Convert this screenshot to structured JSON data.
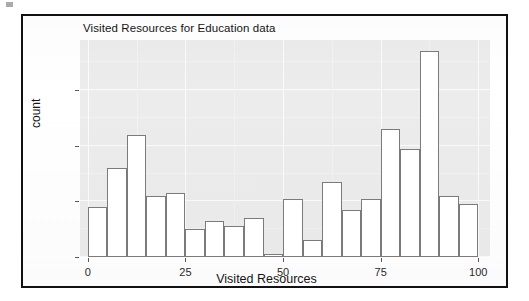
{
  "figure": {
    "title": "Visited Resources for Education data"
  },
  "chart_data": {
    "type": "bar",
    "title": "Visited Resources for Education data",
    "xlabel": "Visited Resources",
    "ylabel": "count",
    "xlim": [
      -2,
      103
    ],
    "ylim": [
      0,
      78
    ],
    "grid": true,
    "legend": null,
    "bin_width": 5,
    "x_ticks": [
      0,
      25,
      50,
      75,
      100
    ],
    "x_tick_labels": [
      "0",
      "25",
      "50",
      "75",
      "100"
    ],
    "y_ticks": [
      0,
      20,
      40,
      60
    ],
    "y_tick_labels": [
      "0",
      "20",
      "40",
      "60"
    ],
    "bins": [
      {
        "start": 0,
        "end": 5,
        "center": 2.5,
        "count": 18
      },
      {
        "start": 5,
        "end": 10,
        "center": 7.5,
        "count": 32
      },
      {
        "start": 10,
        "end": 15,
        "center": 12.5,
        "count": 44
      },
      {
        "start": 15,
        "end": 20,
        "center": 17.5,
        "count": 22
      },
      {
        "start": 20,
        "end": 25,
        "center": 22.5,
        "count": 23
      },
      {
        "start": 25,
        "end": 30,
        "center": 27.5,
        "count": 10
      },
      {
        "start": 30,
        "end": 35,
        "center": 32.5,
        "count": 13
      },
      {
        "start": 35,
        "end": 40,
        "center": 37.5,
        "count": 11
      },
      {
        "start": 40,
        "end": 45,
        "center": 42.5,
        "count": 14
      },
      {
        "start": 45,
        "end": 50,
        "center": 47.5,
        "count": 1
      },
      {
        "start": 50,
        "end": 55,
        "center": 52.5,
        "count": 21
      },
      {
        "start": 55,
        "end": 60,
        "center": 57.5,
        "count": 6
      },
      {
        "start": 60,
        "end": 65,
        "center": 62.5,
        "count": 27
      },
      {
        "start": 65,
        "end": 70,
        "center": 67.5,
        "count": 17
      },
      {
        "start": 70,
        "end": 75,
        "center": 72.5,
        "count": 21
      },
      {
        "start": 75,
        "end": 80,
        "center": 77.5,
        "count": 46
      },
      {
        "start": 80,
        "end": 85,
        "center": 82.5,
        "count": 39
      },
      {
        "start": 85,
        "end": 90,
        "center": 87.5,
        "count": 74
      },
      {
        "start": 90,
        "end": 95,
        "center": 92.5,
        "count": 22
      },
      {
        "start": 95,
        "end": 100,
        "center": 97.5,
        "count": 19
      }
    ],
    "categories": [
      "2.5",
      "7.5",
      "12.5",
      "17.5",
      "22.5",
      "27.5",
      "32.5",
      "37.5",
      "42.5",
      "47.5",
      "52.5",
      "57.5",
      "62.5",
      "67.5",
      "72.5",
      "77.5",
      "82.5",
      "87.5",
      "92.5",
      "97.5"
    ],
    "values": [
      18,
      32,
      44,
      22,
      23,
      10,
      13,
      11,
      14,
      1,
      21,
      6,
      27,
      17,
      21,
      46,
      39,
      74,
      22,
      19
    ]
  },
  "style": {
    "panel_background": "#ececec",
    "bar_fill": "#ffffff",
    "bar_outline": "#7b7b7b",
    "frame_color": "#111111",
    "text_color": "#141414"
  }
}
